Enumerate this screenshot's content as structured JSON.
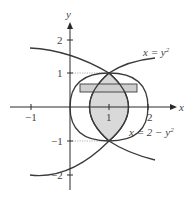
{
  "diagram": {
    "axes": {
      "x_label": "x",
      "y_label": "y",
      "x_ticks": [
        {
          "value": -1,
          "label": "−1"
        },
        {
          "value": 1,
          "label": "1"
        },
        {
          "value": 2,
          "label": "2"
        }
      ],
      "y_ticks": [
        {
          "value": 2,
          "label": "2"
        },
        {
          "value": 1,
          "label": "1"
        },
        {
          "value": -1,
          "label": "−1"
        },
        {
          "value": -2,
          "label": "−2"
        }
      ]
    },
    "curves": [
      {
        "name": "x = y^2",
        "label_main": "x = y",
        "label_sup": "2"
      },
      {
        "name": "x = 2 - y^2",
        "label_main": "x = 2 − y",
        "label_sup": "2"
      }
    ],
    "intersections": [
      {
        "x": 1,
        "y": 1
      },
      {
        "x": 1,
        "y": -1
      }
    ],
    "shaded_region": "region between x = y^2 and x = 2 - y^2, -1 ≤ y ≤ 1",
    "strip": "horizontal approximating rectangle",
    "colors": {
      "shade": "#d9d9d9",
      "curve": "#3a3a3a",
      "axis": "#2a2a2a"
    }
  }
}
